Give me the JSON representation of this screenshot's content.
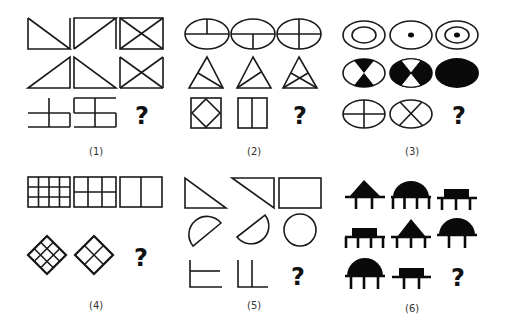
{
  "puzzle": {
    "title": "Figure reasoning puzzles",
    "panels": [
      {
        "id": 1,
        "label": "(1)",
        "question_mark": "?",
        "description": "Line figures: rectangle split by diagonals; row 3 composed of line segments"
      },
      {
        "id": 2,
        "label": "(2)",
        "question_mark": "?",
        "description": "Ellipses with dividing lines, triangles with inner lines, squares with inner shapes"
      },
      {
        "id": 3,
        "label": "(3)",
        "question_mark": "?",
        "description": "Ellipses: concentric/dot, black-white sectors, cross dividers"
      },
      {
        "id": 4,
        "label": "(4)",
        "question_mark": "?",
        "description": "Grid rectangles 4x3, 3x2, 2x1; diamonds 3x3, 2x2"
      },
      {
        "id": 5,
        "label": "(5)",
        "question_mark": "?",
        "description": "Two halves combine into whole: triangles to rectangle, semicircles to circle, L lines"
      },
      {
        "id": 6,
        "label": "(6)",
        "question_mark": "?",
        "description": "Shapes (triangle, dome, rectangle) on bases with varying number of legs"
      }
    ],
    "panel6_legs": [
      [
        2,
        4,
        3
      ],
      [
        4,
        3,
        2
      ],
      [
        3,
        2,
        null
      ]
    ]
  }
}
